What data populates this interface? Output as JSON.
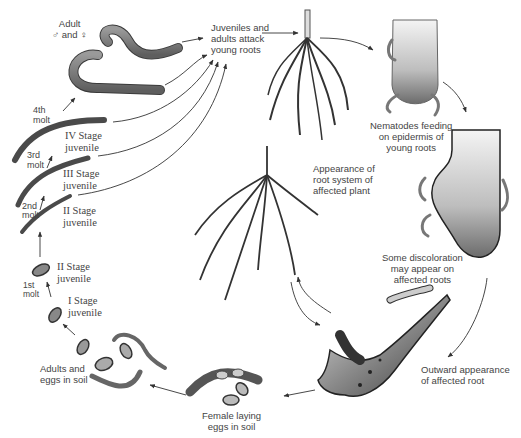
{
  "diagram": {
    "type": "life-cycle",
    "colors": {
      "worm": "#7a7a7a",
      "worm_outline": "#3a3a3a",
      "root": "#5a5a5a",
      "arrow": "#333333",
      "text": "#444444"
    },
    "labels": {
      "adult": "Adult\n♂ and ♀",
      "juveniles_attack": "Juveniles and\nadults attack\nyoung roots",
      "nematodes_feeding": "Nematodes feeding\non epidermis of\nyoung roots",
      "appearance_root_system": "Appearance of\nroot system of\naffected plant",
      "discoloration": "Some discoloration\nmay appear on\naffected roots",
      "outward_appearance": "Outward appearance\nof affected root",
      "female_laying": "Female laying\neggs in soil",
      "adults_eggs": "Adults and\neggs in soil",
      "stage_1": "I Stage\njuvenile",
      "stage_2_egg": "II Stage\njuvenile",
      "molt_1": "1st\nmolt",
      "stage_2": "II Stage\njuvenile",
      "molt_2": "2nd\nmolt",
      "stage_3": "III Stage\njuvenile",
      "molt_3": "3rd\nmolt",
      "stage_4": "IV Stage\njuvenile",
      "molt_4": "4th\nmolt"
    },
    "sequence": [
      "Adults and eggs in soil",
      "I Stage juvenile",
      "1st molt",
      "II Stage juvenile",
      "2nd molt",
      "III Stage juvenile",
      "3rd molt",
      "IV Stage juvenile",
      "4th molt",
      "Adult ♂ and ♀",
      "Juveniles and adults attack young roots",
      "Nematodes feeding on epidermis of young roots",
      "Some discoloration may appear on affected roots",
      "Outward appearance of affected root",
      "Female laying eggs in soil"
    ]
  }
}
